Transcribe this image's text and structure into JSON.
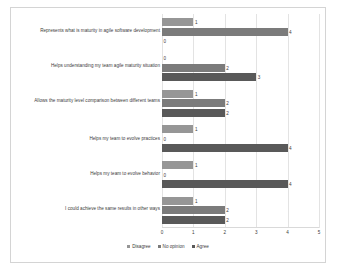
{
  "chart_data": {
    "type": "bar",
    "orientation": "horizontal",
    "title": "",
    "xlabel": "",
    "ylabel": "",
    "xlim": [
      0,
      5
    ],
    "xticks": [
      "0",
      "1",
      "2",
      "3",
      "4",
      "5"
    ],
    "grid": true,
    "legend_position": "bottom-center",
    "categories": [
      "Represents what is maturity in agile software development",
      "Helps understanding my team agile maturity situation",
      "Allows the maturity level comparison between different teams",
      "Helps my team to evolve practices",
      "Helps my team to evolve behavior",
      "I could achieve the same results in other ways"
    ],
    "series": [
      {
        "name": "Disagree",
        "color": "#969696",
        "values": [
          1,
          0,
          1,
          1,
          1,
          1
        ]
      },
      {
        "name": "No opinion",
        "color": "#7b7b7b",
        "values": [
          4,
          2,
          2,
          0,
          0,
          2
        ]
      },
      {
        "name": "Agree",
        "color": "#595959",
        "values": [
          0,
          3,
          2,
          4,
          4,
          2
        ]
      }
    ]
  }
}
